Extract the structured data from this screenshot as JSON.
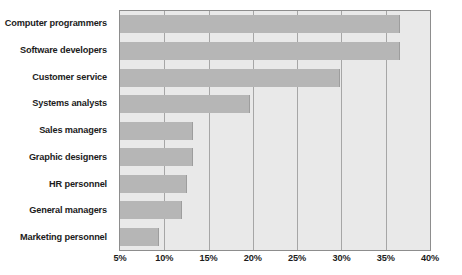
{
  "chart_data": {
    "type": "bar",
    "orientation": "horizontal",
    "title": "",
    "subtitle": "",
    "xlabel": "",
    "ylabel": "",
    "categories": [
      "Computer programmers",
      "Software developers",
      "Customer service",
      "Systems analysts",
      "Sales managers",
      "Graphic designers",
      "HR personnel",
      "General managers",
      "Marketing personnel"
    ],
    "values": [
      36.6,
      36.6,
      29.8,
      19.7,
      13.2,
      13.2,
      12.6,
      12.0,
      9.4
    ],
    "value_suffix": "%",
    "xlim": [
      5,
      40
    ],
    "xticks": [
      5,
      10,
      15,
      20,
      25,
      30,
      35,
      40
    ],
    "xtick_labels": [
      "5%",
      "10%",
      "15%",
      "20%",
      "25%",
      "30%",
      "35%",
      "40%"
    ],
    "grid": true,
    "grid_axis": "x",
    "legend": false,
    "legend_position": "none",
    "series": [
      {
        "name": "Share of respondents",
        "values": [
          36.6,
          36.6,
          29.8,
          19.7,
          13.2,
          13.2,
          12.6,
          12.0,
          9.4
        ]
      }
    ],
    "colors": {
      "bar_fill": "#b6b6b6",
      "bar_edge": "#9d9d9d",
      "plot_background": "#e9e9e9",
      "plot_border": "#8d8d8d",
      "gridline": "#a6a6a6",
      "text": "#1c1c1c",
      "page_background": "#ffffff"
    }
  }
}
